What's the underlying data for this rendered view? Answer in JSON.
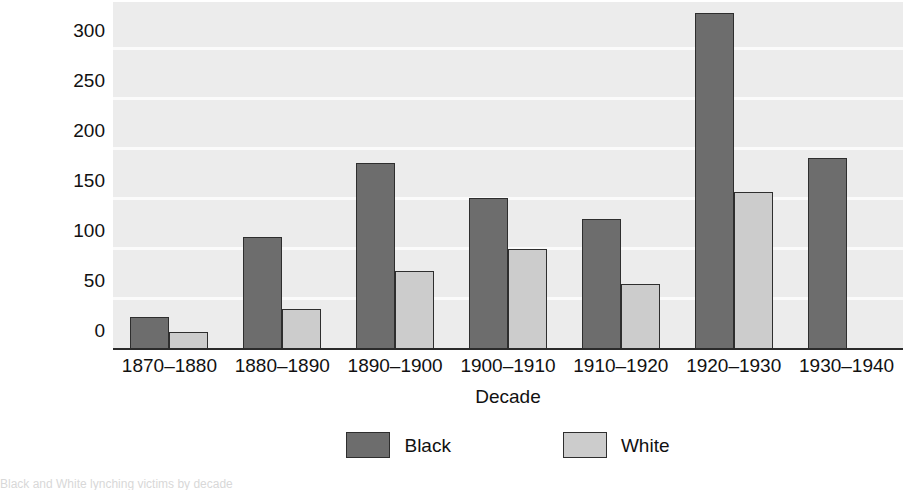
{
  "chart_data": {
    "type": "bar",
    "title": "",
    "xlabel": "Decade",
    "ylabel": "",
    "categories": [
      "1870–1880",
      "1880–1890",
      "1890–1900",
      "1900–1910",
      "1910–1920",
      "1920–1930",
      "1930–1940"
    ],
    "series": [
      {
        "name": "Black",
        "color": "#6d6d6d",
        "values": [
          33,
          113,
          187,
          152,
          131,
          337,
          192
        ]
      },
      {
        "name": "White",
        "color": "#cccccc",
        "values": [
          18,
          41,
          79,
          101,
          66,
          158,
          1
        ]
      }
    ],
    "ylim": [
      0,
      348
    ],
    "yticks": [
      0,
      50,
      100,
      150,
      200,
      250,
      300
    ],
    "ytick_labels": [
      "0",
      "50",
      "100",
      "150",
      "200",
      "250",
      "300"
    ],
    "grid": true,
    "legend_position": "bottom",
    "plot_background": "#ececec",
    "gridline_color": "#fbfbfb",
    "axis_color": "#2b2b2b"
  },
  "legend": {
    "items": [
      {
        "label": "Black",
        "swatch": "black"
      },
      {
        "label": "White",
        "swatch": "white"
      }
    ]
  },
  "caption": {
    "text": "Black and White lynching victims by decade"
  }
}
